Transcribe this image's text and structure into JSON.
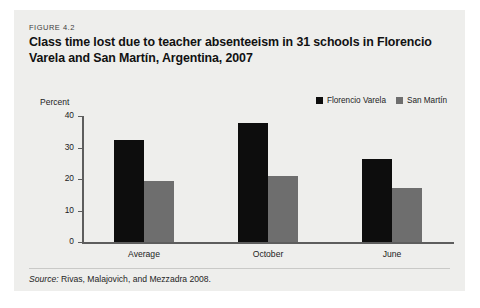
{
  "figure": {
    "kicker": "FIGURE 4.2",
    "title": "Class time lost due to teacher absenteeism in 31 schools in Florencio Varela and San Martín, Argentina, 2007",
    "source_prefix": "Source:",
    "source_text": "Rivas, Malajovich, and Mezzadra 2008."
  },
  "colors": {
    "card_background": "#eeeeec",
    "page_background": "#ffffff",
    "series_florencio_varela": "#0d0d0d",
    "series_san_martin": "#6e6e6e",
    "axis": "#5d5d5d",
    "divider": "#c9c9c7"
  },
  "chart_data": {
    "type": "bar",
    "title": "Class time lost due to teacher absenteeism in 31 schools in Florencio Varela and San Martín, Argentina, 2007",
    "xlabel": "",
    "ylabel": "Percent",
    "ylim": [
      0,
      40
    ],
    "yticks": [
      0,
      10,
      20,
      30,
      40
    ],
    "ytick_labels": [
      "0",
      "10",
      "20",
      "30",
      "40"
    ],
    "grid": false,
    "legend_position": "top-right",
    "categories": [
      "Average",
      "October",
      "June"
    ],
    "series": [
      {
        "name": "Florencio Varela",
        "color": "#0d0d0d",
        "values": [
          32.3,
          37.8,
          26.2
        ]
      },
      {
        "name": "San Martín",
        "color": "#6e6e6e",
        "values": [
          19.5,
          20.8,
          17.3
        ]
      }
    ]
  }
}
